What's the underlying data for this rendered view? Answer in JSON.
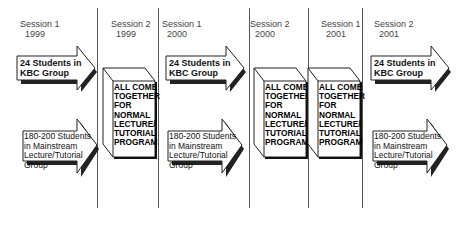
{
  "columns": [
    {
      "session": "Session 1",
      "year": "1999"
    },
    {
      "session": "Session 2",
      "year": "1999"
    },
    {
      "session": "Session 1",
      "year": "2000"
    },
    {
      "session": "Session 2",
      "year": "2000"
    },
    {
      "session": "Session 1",
      "year": "2001"
    },
    {
      "session": "Session 2",
      "year": "2001"
    }
  ],
  "kbc_arrow": {
    "line1": "24 Students in",
    "line2": "KBC Group"
  },
  "mainstream_arrow": {
    "line1": "180-200 Students",
    "line2": "in Mainstream",
    "line3": "Lecture/Tutorial",
    "line4": "Group"
  },
  "together_box": {
    "line1": "ALL COME",
    "line2": "TOGETHER",
    "line3": "FOR",
    "line4": "NORMAL",
    "line5": "LECTURE/",
    "line6": "TUTORIAL",
    "line7": "PROGRAM"
  }
}
